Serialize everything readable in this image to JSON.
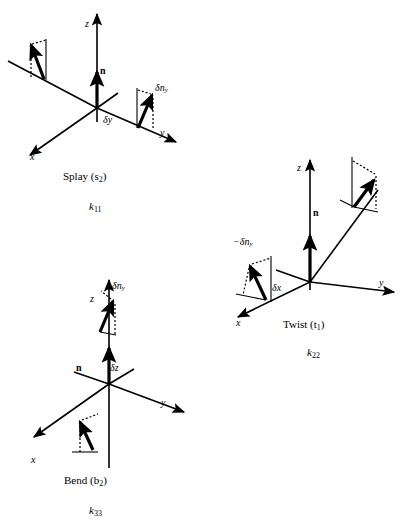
{
  "figure": {
    "background_color": "#ffffff",
    "stroke_color": "#000000"
  },
  "panels": [
    {
      "id": "splay",
      "caption": "Splay (s",
      "caption_sub": "2",
      "caption_close": ")",
      "constant": "k",
      "constant_sub": "11",
      "axes": {
        "z": "z",
        "y": "y",
        "x": "x"
      },
      "director_label": "n",
      "displacement_label": "δy",
      "deviation_label": "δn",
      "deviation_sub": "y"
    },
    {
      "id": "twist",
      "caption": "Twist (t",
      "caption_sub": "1",
      "caption_close": ")",
      "constant": "k",
      "constant_sub": "22",
      "axes": {
        "z": "z",
        "y": "y",
        "x": "x"
      },
      "director_label": "n",
      "displacement_label": "δx",
      "deviation_label": "−δn",
      "deviation_sub": "y"
    },
    {
      "id": "bend",
      "caption": "Bend (b",
      "caption_sub": "2",
      "caption_close": ")",
      "constant": "k",
      "constant_sub": "33",
      "axes": {
        "z": "z",
        "y": "y",
        "x": "x"
      },
      "director_label": "n",
      "displacement_label": "δz",
      "deviation_label": "δn",
      "deviation_sub": "y"
    }
  ]
}
